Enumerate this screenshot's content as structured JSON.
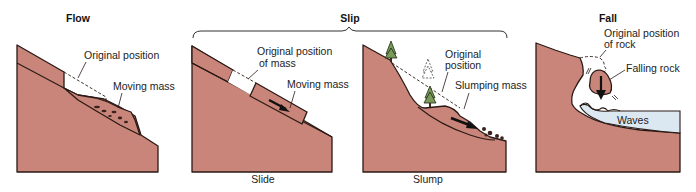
{
  "diagram": {
    "panels": {
      "flow": {
        "title": "Flow",
        "labels": {
          "original": "Original position",
          "moving": "Moving mass"
        }
      },
      "slip": {
        "title": "Slip",
        "slide": {
          "caption": "Slide",
          "labels": {
            "original_line1": "Original position",
            "original_line2": "of mass",
            "moving": "Moving mass"
          }
        },
        "slump": {
          "caption": "Slump",
          "labels": {
            "original_line1": "Original",
            "original_line2": "position",
            "slumping": "Slumping mass"
          }
        }
      },
      "fall": {
        "title": "Fall",
        "labels": {
          "original_line1": "Original position",
          "original_line2": "of rock",
          "falling": "Falling rock",
          "waves": "Waves"
        }
      }
    },
    "colors": {
      "ground": "#c9857a",
      "water": "#dbe8f2",
      "outline": "#2a1a16"
    }
  }
}
